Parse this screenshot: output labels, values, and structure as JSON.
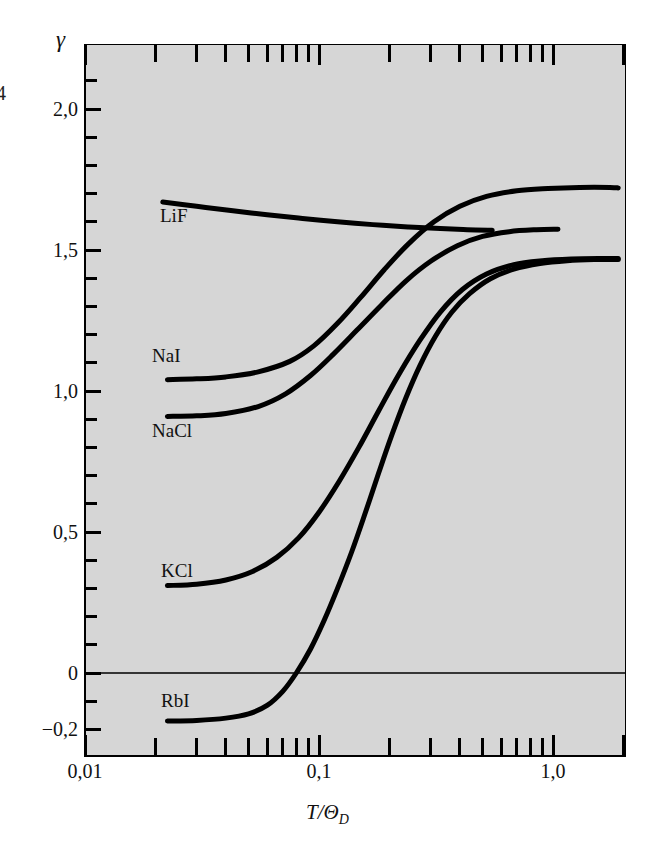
{
  "figure": {
    "background_color": "#ffffff",
    "panel_color": "#d6d6d6",
    "curve_color": "#000000",
    "edge_glyph": "4"
  },
  "axes": {
    "y_symbol": "γ",
    "y_tick_labels": [
      "2,0",
      "1,5",
      "1,0",
      "0,5",
      "0",
      "−0,2"
    ],
    "y_tick_values": [
      2.0,
      1.5,
      1.0,
      0.5,
      0.0,
      -0.2
    ],
    "x_tick_labels": [
      "0,01",
      "0,1",
      "1,0"
    ],
    "x_tick_values": [
      0.01,
      0.1,
      1.0
    ],
    "x_axis_title": "T/Θ",
    "x_axis_title_sub": "D"
  },
  "curve_labels": [
    {
      "name": "LiF",
      "text": "LiF"
    },
    {
      "name": "NaI",
      "text": "NaI"
    },
    {
      "name": "NaCl",
      "text": "NaCl"
    },
    {
      "name": "KCl",
      "text": "KCl"
    },
    {
      "name": "RbI",
      "text": "RbI"
    }
  ],
  "chart_data": {
    "type": "line",
    "title": "",
    "xlabel": "T/Θ_D",
    "ylabel": "γ",
    "xscale": "log",
    "xlim": [
      0.01,
      2.0
    ],
    "ylim": [
      -0.24,
      2.2
    ],
    "grid": false,
    "legend": "inline-curve-labels",
    "y_ticks_major": [
      2.0,
      1.5,
      1.0,
      0.5,
      0.0,
      -0.2
    ],
    "y_ticks_minor_step": 0.1,
    "x_ticks_major": [
      0.01,
      0.1,
      1.0
    ],
    "annotations": [
      "horizontal zero line at γ = 0"
    ],
    "series": [
      {
        "name": "LiF",
        "points": [
          [
            0.0215,
            1.67
          ],
          [
            0.03,
            1.655
          ],
          [
            0.042,
            1.64
          ],
          [
            0.06,
            1.625
          ],
          [
            0.085,
            1.612
          ],
          [
            0.12,
            1.6
          ],
          [
            0.17,
            1.59
          ],
          [
            0.24,
            1.582
          ],
          [
            0.33,
            1.576
          ],
          [
            0.43,
            1.572
          ],
          [
            0.55,
            1.57
          ]
        ]
      },
      {
        "name": "NaI",
        "points": [
          [
            0.0225,
            1.04
          ],
          [
            0.03,
            1.043
          ],
          [
            0.04,
            1.05
          ],
          [
            0.055,
            1.068
          ],
          [
            0.075,
            1.105
          ],
          [
            0.095,
            1.16
          ],
          [
            0.12,
            1.24
          ],
          [
            0.15,
            1.33
          ],
          [
            0.19,
            1.43
          ],
          [
            0.24,
            1.52
          ],
          [
            0.31,
            1.6
          ],
          [
            0.4,
            1.655
          ],
          [
            0.52,
            1.69
          ],
          [
            0.7,
            1.71
          ],
          [
            0.95,
            1.718
          ],
          [
            1.3,
            1.722
          ],
          [
            1.75,
            1.722
          ],
          [
            1.9,
            1.72
          ]
        ]
      },
      {
        "name": "NaCl",
        "points": [
          [
            0.0225,
            0.91
          ],
          [
            0.03,
            0.912
          ],
          [
            0.04,
            0.92
          ],
          [
            0.055,
            0.945
          ],
          [
            0.072,
            0.99
          ],
          [
            0.092,
            1.055
          ],
          [
            0.115,
            1.13
          ],
          [
            0.145,
            1.215
          ],
          [
            0.185,
            1.305
          ],
          [
            0.235,
            1.39
          ],
          [
            0.3,
            1.46
          ],
          [
            0.39,
            1.515
          ],
          [
            0.5,
            1.548
          ],
          [
            0.65,
            1.565
          ],
          [
            0.85,
            1.572
          ],
          [
            1.05,
            1.574
          ]
        ]
      },
      {
        "name": "KCl",
        "points": [
          [
            0.0225,
            0.31
          ],
          [
            0.03,
            0.315
          ],
          [
            0.04,
            0.33
          ],
          [
            0.052,
            0.36
          ],
          [
            0.066,
            0.41
          ],
          [
            0.082,
            0.48
          ],
          [
            0.1,
            0.57
          ],
          [
            0.122,
            0.68
          ],
          [
            0.148,
            0.8
          ],
          [
            0.18,
            0.93
          ],
          [
            0.22,
            1.06
          ],
          [
            0.27,
            1.18
          ],
          [
            0.33,
            1.28
          ],
          [
            0.41,
            1.36
          ],
          [
            0.52,
            1.415
          ],
          [
            0.68,
            1.448
          ],
          [
            0.9,
            1.462
          ],
          [
            1.2,
            1.468
          ],
          [
            1.6,
            1.47
          ],
          [
            1.9,
            1.47
          ]
        ]
      },
      {
        "name": "RbI",
        "points": [
          [
            0.0225,
            -0.17
          ],
          [
            0.03,
            -0.168
          ],
          [
            0.04,
            -0.16
          ],
          [
            0.05,
            -0.145
          ],
          [
            0.06,
            -0.115
          ],
          [
            0.07,
            -0.065
          ],
          [
            0.08,
            0.0
          ],
          [
            0.092,
            0.085
          ],
          [
            0.105,
            0.185
          ],
          [
            0.12,
            0.3
          ],
          [
            0.138,
            0.43
          ],
          [
            0.158,
            0.57
          ],
          [
            0.18,
            0.71
          ],
          [
            0.205,
            0.845
          ],
          [
            0.235,
            0.975
          ],
          [
            0.27,
            1.09
          ],
          [
            0.315,
            1.195
          ],
          [
            0.37,
            1.28
          ],
          [
            0.44,
            1.345
          ],
          [
            0.54,
            1.398
          ],
          [
            0.68,
            1.432
          ],
          [
            0.88,
            1.452
          ],
          [
            1.15,
            1.462
          ],
          [
            1.5,
            1.466
          ],
          [
            1.9,
            1.466
          ]
        ]
      }
    ]
  }
}
